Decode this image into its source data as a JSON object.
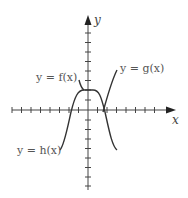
{
  "diagram": {
    "type": "function-graph",
    "axes": {
      "x_label": "x",
      "y_label": "y",
      "tick_spacing_px": 9.5,
      "x_ticks": [
        -8,
        -7,
        -6,
        -5,
        -4,
        -3,
        -2,
        -1,
        1,
        2,
        3,
        4,
        5,
        6,
        7,
        8
      ],
      "y_ticks": [
        -7,
        -6,
        -5,
        -4,
        -3,
        -2,
        -1,
        1,
        2,
        3,
        4,
        5,
        6,
        7,
        8,
        9
      ]
    },
    "curves": [
      {
        "name": "f",
        "label": "y = f(x)",
        "color": "#333333"
      },
      {
        "name": "g",
        "label": "y = g(x)",
        "color": "#333333"
      },
      {
        "name": "h",
        "label": "y = h(x)",
        "color": "#333333"
      }
    ]
  }
}
